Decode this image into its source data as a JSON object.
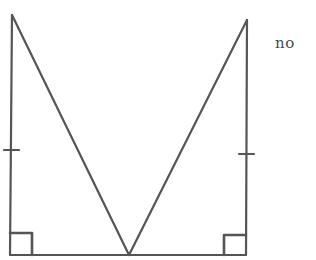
{
  "diagram": {
    "type": "geometry",
    "answer_label": "no",
    "stroke_color": "#555555",
    "points": {
      "left_top": [
        12,
        15
      ],
      "left_bottom": [
        10,
        255
      ],
      "apex": [
        129,
        255
      ],
      "right_top": [
        247,
        20
      ],
      "right_bottom": [
        246,
        255
      ]
    },
    "tick_marks": [
      {
        "side": "left",
        "y": 150
      },
      {
        "side": "right",
        "y": 154
      }
    ],
    "right_angles": [
      "left_bottom",
      "right_bottom"
    ]
  }
}
